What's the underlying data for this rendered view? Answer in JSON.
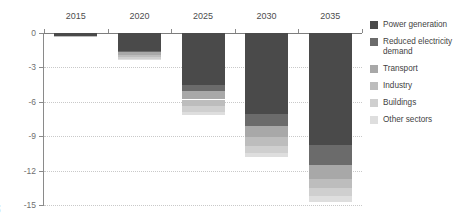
{
  "chart_data": {
    "type": "bar",
    "title": "",
    "subtitle": "",
    "xlabel": "",
    "ylabel": "Gt",
    "categories": [
      "2015",
      "2020",
      "2025",
      "2030",
      "2035"
    ],
    "ylim": [
      -15,
      0
    ],
    "yticks": [
      "0",
      "-3",
      "-6",
      "-9",
      "-12",
      "-15"
    ],
    "ytick_values": [
      0,
      -3,
      -6,
      -9,
      -12,
      -15
    ],
    "grid": true,
    "stacked": true,
    "orientation": "vertical-negative",
    "legend_position": "right",
    "series": [
      {
        "name": "Power generation",
        "color": "#4a4a4a",
        "values": [
          -0.25,
          -1.55,
          -4.55,
          -7.05,
          -9.8
        ]
      },
      {
        "name": "Reduced electricity demand",
        "color": "#6b6b6b",
        "values": [
          0.0,
          -0.1,
          -0.55,
          -1.1,
          -1.7
        ]
      },
      {
        "name": "Transport",
        "color": "#a8a8a8",
        "values": [
          0.0,
          -0.25,
          -0.7,
          -0.95,
          -1.2
        ]
      },
      {
        "name": "Industry",
        "color": "#bdbdbd",
        "values": [
          -0.05,
          -0.2,
          -0.6,
          -0.75,
          -0.85
        ]
      },
      {
        "name": "Buildings",
        "color": "#cfcfcf",
        "values": [
          0.0,
          -0.15,
          -0.45,
          -0.6,
          -0.7
        ]
      },
      {
        "name": "Other sectors",
        "color": "#dedede",
        "values": [
          0.0,
          -0.1,
          -0.3,
          -0.4,
          -0.45
        ]
      }
    ],
    "totals": [
      -0.3,
      -2.35,
      -7.15,
      -10.85,
      -14.7
    ]
  },
  "axis": {
    "y_unit_label": "Gt"
  },
  "legend": {
    "items": [
      {
        "label": "Power generation"
      },
      {
        "label": "Reduced electricity demand"
      },
      {
        "label": "Transport"
      },
      {
        "label": "Industry"
      },
      {
        "label": "Buildings"
      },
      {
        "label": "Other sectors"
      }
    ]
  }
}
